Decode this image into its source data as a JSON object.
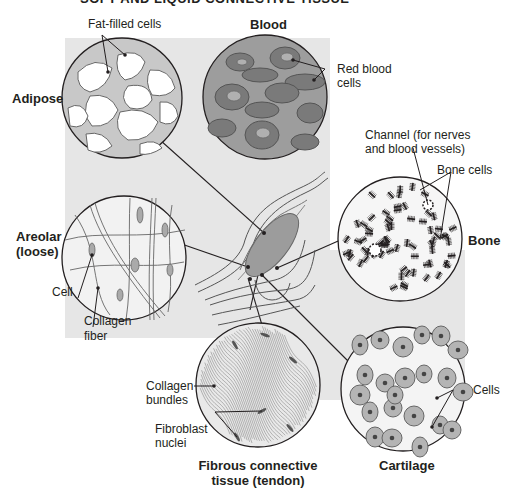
{
  "figure": {
    "title": "SOFT AND LIQUID CONNECTIVE TISSUE",
    "tissues": {
      "adipose": {
        "name": "Adipose",
        "labels": [
          "Fat-filled cells"
        ]
      },
      "blood": {
        "name": "Blood",
        "labels": [
          "Red blood",
          "cells"
        ]
      },
      "bone": {
        "name": "Bone",
        "labels": [
          "Channel (for nerves",
          "and blood vessels)",
          "Bone cells"
        ]
      },
      "areolar": {
        "name_line1": "Areolar",
        "name_line2": "(loose)",
        "labels": [
          "Cell",
          "Collagen",
          "fiber"
        ]
      },
      "fibrous": {
        "name_line1": "Fibrous connective",
        "name_line2": "tissue (tendon)",
        "labels": [
          "Collagen",
          "bundles",
          "Fibroblast",
          "nuclei"
        ]
      },
      "cartilage": {
        "name": "Cartilage",
        "labels": [
          "Cells"
        ]
      }
    },
    "colors": {
      "panel": "#e4e4e4",
      "outline": "#231f20",
      "blood_plasma": "#9d9d9d",
      "rbc": "#7a7a7a",
      "cell_fill": "#b4b4b4",
      "adipose_bg": "#c8c8c8"
    }
  }
}
